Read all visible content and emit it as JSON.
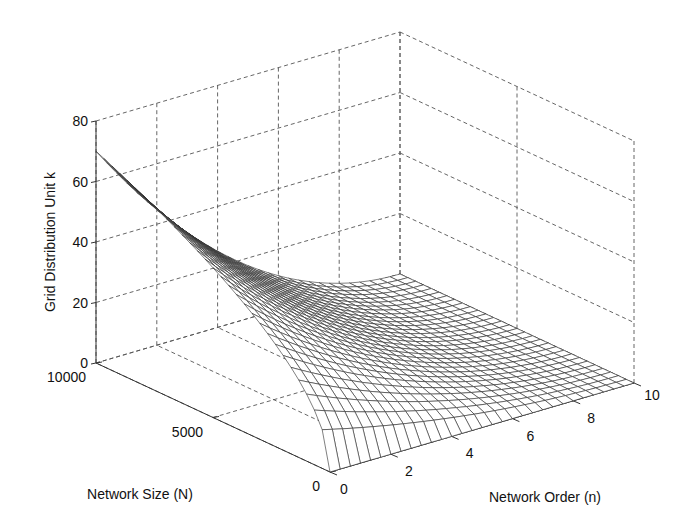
{
  "chart_data": {
    "type": "surface",
    "title": "",
    "xlabel": "Network Order (n)",
    "ylabel": "Network Size (N)",
    "zlabel": "Grid Distribution Unit k",
    "x_ticks": [
      "0",
      "2",
      "4",
      "6",
      "8",
      "10"
    ],
    "y_ticks": [
      "0",
      "5000",
      "10000"
    ],
    "z_ticks": [
      "0",
      "20",
      "40",
      "60",
      "80"
    ],
    "xlim": [
      0,
      10
    ],
    "ylim": [
      0,
      10000
    ],
    "zlim": [
      0,
      80
    ],
    "grid": true,
    "mesh": {
      "n_steps": 30,
      "N_steps": 30
    },
    "approx_formula": "k = 0.7 * sqrt(N) * (1 - n/10)^2",
    "sample_points": [
      {
        "N": 10000,
        "n": 0,
        "k": 70
      },
      {
        "N": 10000,
        "n": 5,
        "k": 17.5
      },
      {
        "N": 10000,
        "n": 10,
        "k": 0
      },
      {
        "N": 5000,
        "n": 0,
        "k": 49.5
      },
      {
        "N": 5000,
        "n": 5,
        "k": 12.4
      },
      {
        "N": 0,
        "n": 0,
        "k": 0
      },
      {
        "N": 0,
        "n": 10,
        "k": 0
      }
    ]
  },
  "colors": {
    "mesh": "#2a2a2a",
    "grid": "#555555",
    "background": "#ffffff"
  }
}
